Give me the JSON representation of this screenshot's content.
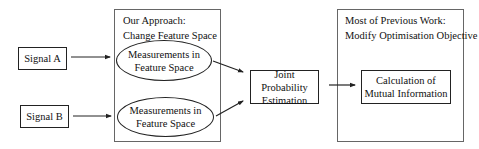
{
  "diagram": {
    "inputs": [
      {
        "id": "signal-a",
        "label": "Signal A"
      },
      {
        "id": "signal-b",
        "label": "Signal B"
      }
    ],
    "our_approach": {
      "title_line1": "Our Approach:",
      "title_line2": "Change Feature Space",
      "nodes": [
        {
          "line1": "Measurements in",
          "line2": "Feature Space"
        },
        {
          "line1": "Measurements in",
          "line2": "Feature Space"
        }
      ]
    },
    "joint_probability": {
      "line1": "Joint Probability",
      "line2": "Estimation"
    },
    "previous_work": {
      "title_line1": "Most of Previous Work:",
      "title_line2": "Modify Optimisation Objective",
      "node": {
        "line1": "Calculation of",
        "line2": "Mutual Information"
      }
    },
    "edges": [
      {
        "from": "Signal A",
        "to": "Measurements in Feature Space (1)"
      },
      {
        "from": "Signal B",
        "to": "Measurements in Feature Space (2)"
      },
      {
        "from": "Measurements in Feature Space (1)",
        "to": "Joint Probability Estimation"
      },
      {
        "from": "Measurements in Feature Space (2)",
        "to": "Joint Probability Estimation"
      },
      {
        "from": "Joint Probability Estimation",
        "to": "Calculation of Mutual Information"
      }
    ]
  }
}
